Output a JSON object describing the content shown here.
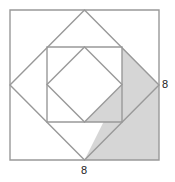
{
  "figure": {
    "kind": "geometry-diagram",
    "width": 175,
    "height": 182,
    "background_color": "#ffffff",
    "stroke_color": "#999999",
    "shade_color": "#d6d6d6",
    "stroke_width": 1.4
  },
  "labels": {
    "right_side": {
      "text": "8",
      "name": "right-side-length-label",
      "describes": "outer square right side length"
    },
    "bottom_side": {
      "text": "8",
      "name": "bottom-side-length-label",
      "describes": "outer square bottom side length"
    }
  },
  "shapes": {
    "outer_square": {
      "name": "outer-square",
      "type": "square",
      "points": "10,10 159,10 159,160 10,160",
      "side_label": "8",
      "filled": false
    },
    "diamond_outer": {
      "name": "outer-diamond",
      "type": "rotated-square",
      "points": "84.5,10 159,85 84.5,160 10,85",
      "filled": false
    },
    "inner_square": {
      "name": "inner-square",
      "type": "square",
      "points": "47,47 122,47 122,122 47,122",
      "filled": false
    },
    "diamond_inner": {
      "name": "inner-diamond",
      "type": "rotated-square",
      "points": "84.5,47 122,84.5 84.5,122 47,84.5",
      "filled": false
    },
    "shaded_wedge": {
      "name": "shaded-upper-wedge",
      "type": "triangle",
      "points": "122,47 159,85 122,85",
      "filled": true
    },
    "shaded_region": {
      "name": "shaded-lower-region",
      "type": "polygon",
      "points": "122,85 159,85 159,160 84.5,160",
      "filled": true
    },
    "shaded_mid_strip": {
      "name": "shaded-mid-strip",
      "type": "polygon",
      "points": "122,85 84.5,122 122,122",
      "filled": true
    }
  }
}
